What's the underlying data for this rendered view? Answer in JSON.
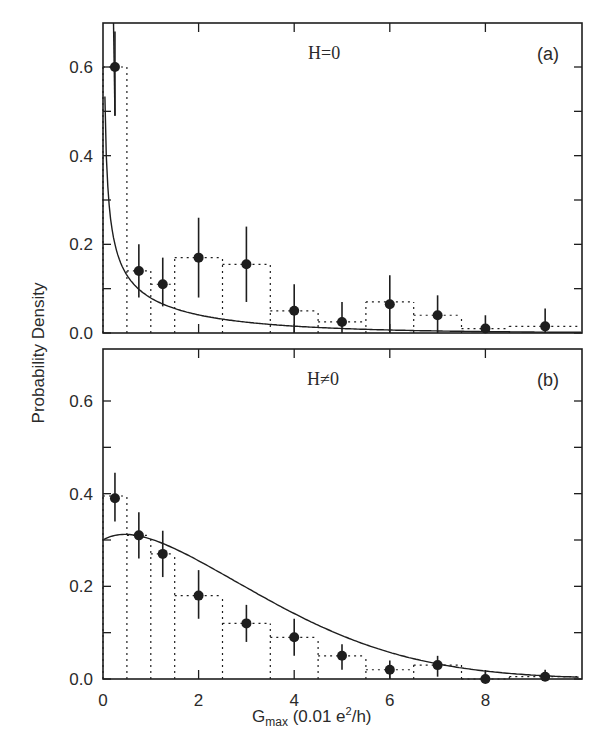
{
  "chart_data": [
    {
      "type": "bar",
      "panel": "(a)",
      "title": "H=0",
      "xlabel": "G_max (0.01 e^2/h)",
      "ylabel": "Probability Density",
      "xlim": [
        0,
        10
      ],
      "ylim": [
        0,
        0.7
      ],
      "xticks": [
        "0",
        "2",
        "4",
        "6",
        "8"
      ],
      "yticks": [
        "0.0",
        "0.2",
        "0.4",
        "0.6"
      ],
      "histogram_bins": [
        {
          "x0": 0.0,
          "x1": 0.5,
          "height": 0.6
        },
        {
          "x0": 0.5,
          "x1": 1.0,
          "height": 0.14
        },
        {
          "x0": 1.0,
          "x1": 1.5,
          "height": 0.11
        },
        {
          "x0": 1.5,
          "x1": 2.5,
          "height": 0.17
        },
        {
          "x0": 2.5,
          "x1": 3.5,
          "height": 0.155
        },
        {
          "x0": 3.5,
          "x1": 4.5,
          "height": 0.05
        },
        {
          "x0": 4.5,
          "x1": 5.5,
          "height": 0.025
        },
        {
          "x0": 5.5,
          "x1": 6.5,
          "height": 0.07
        },
        {
          "x0": 6.5,
          "x1": 7.5,
          "height": 0.04
        },
        {
          "x0": 7.5,
          "x1": 8.5,
          "height": 0.01
        },
        {
          "x0": 8.5,
          "x1": 10.0,
          "height": 0.015
        }
      ],
      "points": [
        {
          "x": 0.25,
          "y": 0.6,
          "err_lo": 0.49,
          "err_hi": 0.68
        },
        {
          "x": 0.75,
          "y": 0.14,
          "err_lo": 0.08,
          "err_hi": 0.2
        },
        {
          "x": 1.25,
          "y": 0.11,
          "err_lo": 0.06,
          "err_hi": 0.17
        },
        {
          "x": 2.0,
          "y": 0.17,
          "err_lo": 0.08,
          "err_hi": 0.26
        },
        {
          "x": 3.0,
          "y": 0.155,
          "err_lo": 0.07,
          "err_hi": 0.24
        },
        {
          "x": 4.0,
          "y": 0.05,
          "err_lo": 0.0,
          "err_hi": 0.11
        },
        {
          "x": 5.0,
          "y": 0.025,
          "err_lo": 0.0,
          "err_hi": 0.07
        },
        {
          "x": 6.0,
          "y": 0.065,
          "err_lo": 0.0,
          "err_hi": 0.13
        },
        {
          "x": 7.0,
          "y": 0.04,
          "err_lo": 0.0,
          "err_hi": 0.085
        },
        {
          "x": 8.0,
          "y": 0.01,
          "err_lo": 0.0,
          "err_hi": 0.04
        },
        {
          "x": 9.25,
          "y": 0.015,
          "err_lo": 0.0,
          "err_hi": 0.055
        }
      ],
      "fit_curve": "decaying ~ x^-1/2 exp-like, diverging at 0"
    },
    {
      "type": "bar",
      "panel": "(b)",
      "title": "H≠0",
      "xlabel": "G_max (0.01 e^2/h)",
      "ylabel": "Probability Density",
      "xlim": [
        0,
        10
      ],
      "ylim": [
        0,
        0.7
      ],
      "xticks": [
        "0",
        "2",
        "4",
        "6",
        "8"
      ],
      "yticks": [
        "0.0",
        "0.2",
        "0.4",
        "0.6"
      ],
      "histogram_bins": [
        {
          "x0": 0.0,
          "x1": 0.5,
          "height": 0.395
        },
        {
          "x0": 0.5,
          "x1": 1.0,
          "height": 0.31
        },
        {
          "x0": 1.0,
          "x1": 1.5,
          "height": 0.27
        },
        {
          "x0": 1.5,
          "x1": 2.5,
          "height": 0.18
        },
        {
          "x0": 2.5,
          "x1": 3.5,
          "height": 0.12
        },
        {
          "x0": 3.5,
          "x1": 4.5,
          "height": 0.09
        },
        {
          "x0": 4.5,
          "x1": 5.5,
          "height": 0.05
        },
        {
          "x0": 5.5,
          "x1": 6.5,
          "height": 0.02
        },
        {
          "x0": 6.5,
          "x1": 7.5,
          "height": 0.03
        },
        {
          "x0": 7.5,
          "x1": 8.5,
          "height": 0.0
        },
        {
          "x0": 8.5,
          "x1": 10.0,
          "height": 0.005
        }
      ],
      "points": [
        {
          "x": 0.25,
          "y": 0.39,
          "err_lo": 0.34,
          "err_hi": 0.445
        },
        {
          "x": 0.75,
          "y": 0.31,
          "err_lo": 0.26,
          "err_hi": 0.36
        },
        {
          "x": 1.25,
          "y": 0.27,
          "err_lo": 0.22,
          "err_hi": 0.32
        },
        {
          "x": 2.0,
          "y": 0.18,
          "err_lo": 0.13,
          "err_hi": 0.235
        },
        {
          "x": 3.0,
          "y": 0.12,
          "err_lo": 0.08,
          "err_hi": 0.16
        },
        {
          "x": 4.0,
          "y": 0.09,
          "err_lo": 0.05,
          "err_hi": 0.13
        },
        {
          "x": 5.0,
          "y": 0.05,
          "err_lo": 0.02,
          "err_hi": 0.075
        },
        {
          "x": 6.0,
          "y": 0.02,
          "err_lo": 0.0,
          "err_hi": 0.04
        },
        {
          "x": 7.0,
          "y": 0.03,
          "err_lo": 0.005,
          "err_hi": 0.05
        },
        {
          "x": 8.0,
          "y": 0.0,
          "err_lo": 0.0,
          "err_hi": 0.015
        },
        {
          "x": 9.25,
          "y": 0.005,
          "err_lo": 0.0,
          "err_hi": 0.02
        }
      ],
      "fit_curve": "rises from 0.30 at x=0 to peak ~0.32 near x=0.4, then decays to 0 by ~9"
    }
  ],
  "labels": {
    "ylabel": "Probability Density",
    "xlabel_main": "G",
    "xlabel_sub": "max",
    "xlabel_rest": " (0.01 e",
    "xlabel_sup": "2",
    "xlabel_end": "/h)",
    "panel_a_title": "H=0",
    "panel_a_tag": "(a)",
    "panel_b_title": "H≠0",
    "panel_b_tag": "(b)",
    "yticks": [
      "0.0",
      "0.2",
      "0.4",
      "0.6"
    ],
    "xticks": [
      "0",
      "2",
      "4",
      "6",
      "8"
    ]
  },
  "colors": {
    "ink": "#1e1e1e",
    "background": "#ffffff"
  }
}
